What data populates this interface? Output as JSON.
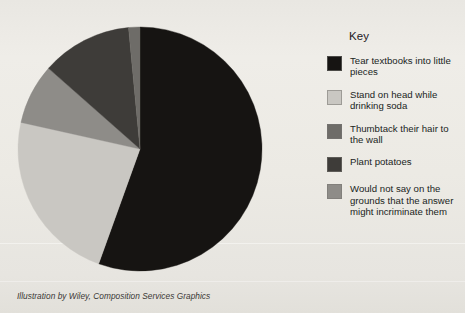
{
  "caption": "Illustration by Wiley, Composition Services Graphics",
  "legend": {
    "title": "Key",
    "items": [
      {
        "label": "Tear textbooks into little pieces",
        "color": "#161412",
        "swatch_name": "legend-swatch-black"
      },
      {
        "label": "Stand on head while drinking soda",
        "color": "#c9c7c2",
        "swatch_name": "legend-swatch-light-grey"
      },
      {
        "label": "Thumbtack their hair to the wall",
        "color": "#6e6c68",
        "swatch_name": "legend-swatch-medium-dark-grey"
      },
      {
        "label": "Plant potatoes",
        "color": "#3e3c39",
        "swatch_name": "legend-swatch-dark-grey"
      },
      {
        "label": "Would not say on the grounds that the answer might incriminate them",
        "color": "#8e8c88",
        "swatch_name": "legend-swatch-medium-grey"
      }
    ]
  },
  "chart_data": {
    "type": "pie",
    "title": "",
    "legend_title": "Key",
    "legend_position": "right",
    "grid": false,
    "start_angle_deg": 0,
    "direction": "clockwise",
    "center": {
      "x": 123,
      "y": 123
    },
    "radius": 122,
    "categories": [
      "Tear textbooks into little pieces",
      "Stand on head while drinking soda",
      "Would not say on the grounds that the answer might incriminate them",
      "Plant potatoes",
      "Thumbtack their hair to the wall"
    ],
    "values": [
      55.5,
      23,
      8,
      12,
      1.5
    ],
    "colors": [
      "#161412",
      "#c9c7c2",
      "#8e8c88",
      "#3e3c39",
      "#6e6c68"
    ],
    "slices": [
      {
        "label": "Tear textbooks into little pieces",
        "value": 55.5,
        "color": "#161412",
        "start_deg": 0,
        "end_deg": 199.8
      },
      {
        "label": "Stand on head while drinking soda",
        "value": 23,
        "color": "#c9c7c2",
        "start_deg": 199.8,
        "end_deg": 282.6
      },
      {
        "label": "Would not say on the grounds that the answer might incriminate them",
        "value": 8,
        "color": "#8e8c88",
        "start_deg": 282.6,
        "end_deg": 311.4
      },
      {
        "label": "Plant potatoes",
        "value": 12,
        "color": "#3e3c39",
        "start_deg": 311.4,
        "end_deg": 354.6
      },
      {
        "label": "Thumbtack their hair to the wall",
        "value": 1.5,
        "color": "#6e6c68",
        "start_deg": 354.6,
        "end_deg": 360
      }
    ]
  }
}
